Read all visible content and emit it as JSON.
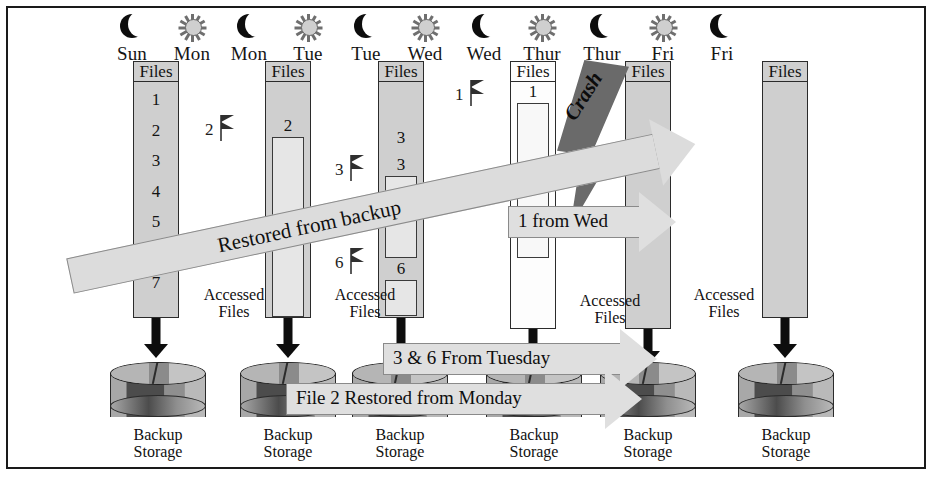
{
  "diagram": {
    "columns_header_label": "Files",
    "accessed_files_label": "Accessed\nFiles",
    "accessed_label_line1": "Accessed",
    "accessed_label_line2": "Files",
    "backup_label_line1": "Backup",
    "backup_label_line2": "Storage",
    "crash_label": "Crash"
  },
  "day_headers": [
    {
      "icon": "moon-icon",
      "phase": "night",
      "label": "Sun",
      "x": 132
    },
    {
      "icon": "sun-icon",
      "phase": "day",
      "label": "Mon",
      "x": 192
    },
    {
      "icon": "moon-icon",
      "phase": "night",
      "label": "Mon",
      "x": 249
    },
    {
      "icon": "sun-icon",
      "phase": "day",
      "label": "Tue",
      "x": 308
    },
    {
      "icon": "moon-icon",
      "phase": "night",
      "label": "Tue",
      "x": 366
    },
    {
      "icon": "sun-icon",
      "phase": "day",
      "label": "Wed",
      "x": 425
    },
    {
      "icon": "moon-icon",
      "phase": "night",
      "label": "Wed",
      "x": 484
    },
    {
      "icon": "sun-icon",
      "phase": "day",
      "label": "Thur",
      "x": 542
    },
    {
      "icon": "moon-icon",
      "phase": "night",
      "label": "Thur",
      "x": 602
    },
    {
      "icon": "sun-icon",
      "phase": "day",
      "label": "Fri",
      "x": 663
    },
    {
      "icon": "moon-icon",
      "phase": "night",
      "label": "Fri",
      "x": 722
    }
  ],
  "file_columns": [
    {
      "day": "Sun",
      "header": "Files",
      "x": 133,
      "y": 61,
      "w": 46,
      "h": 257,
      "fill": "gray",
      "file_numbers": [
        "1",
        "2",
        "3",
        "4",
        "5",
        "6",
        "7"
      ],
      "bars": []
    },
    {
      "day": "Mon",
      "header": "Files",
      "x": 265,
      "y": 61,
      "w": 46,
      "h": 257,
      "fill": "gray",
      "file_numbers": [
        "2"
      ],
      "bars": [
        {
          "label": "2",
          "top": 137,
          "h": 180
        }
      ]
    },
    {
      "day": "Tue",
      "header": "Files",
      "x": 378,
      "y": 61,
      "w": 46,
      "h": 257,
      "fill": "gray",
      "file_numbers": [
        "3",
        "6"
      ],
      "bars": [
        {
          "label": "3",
          "top": 176,
          "h": 82
        },
        {
          "label": "6",
          "top": 280,
          "h": 36
        }
      ]
    },
    {
      "day": "Wed",
      "header": "Files",
      "x": 510,
      "y": 61,
      "w": 46,
      "h": 268,
      "fill": "white",
      "file_numbers": [
        "1"
      ],
      "bars": [
        {
          "label": "1",
          "top": 103,
          "h": 155
        }
      ]
    },
    {
      "day": "Thur",
      "header": "Files",
      "x": 625,
      "y": 61,
      "w": 46,
      "h": 268,
      "fill": "gray",
      "file_numbers": [],
      "bars": []
    },
    {
      "day": "Fri",
      "header": "Files",
      "x": 762,
      "y": 61,
      "w": 46,
      "h": 257,
      "fill": "gray",
      "file_numbers": [],
      "bars": []
    }
  ],
  "flags": [
    {
      "number": "2",
      "x": 205,
      "y": 115
    },
    {
      "number": "3",
      "x": 335,
      "y": 155
    },
    {
      "number": "6",
      "x": 335,
      "y": 248
    },
    {
      "number": "1",
      "x": 455,
      "y": 80
    }
  ],
  "accessed_labels": [
    {
      "x": 186,
      "y": 286
    },
    {
      "x": 317,
      "y": 286
    },
    {
      "x": 562,
      "y": 292
    },
    {
      "x": 676,
      "y": 286
    }
  ],
  "backup_cylinders": [
    {
      "x": 110,
      "y": 362,
      "label_line1": "Backup",
      "label_line2": "Storage"
    },
    {
      "x": 240,
      "y": 362,
      "label_line1": "Backup",
      "label_line2": "Storage"
    },
    {
      "x": 352,
      "y": 362,
      "label_line1": "Backup",
      "label_line2": "Storage"
    },
    {
      "x": 486,
      "y": 362,
      "label_line1": "Backup",
      "label_line2": "Storage"
    },
    {
      "x": 600,
      "y": 362,
      "label_line1": "Backup",
      "label_line2": "Storage"
    },
    {
      "x": 738,
      "y": 362,
      "label_line1": "Backup",
      "label_line2": "Storage"
    }
  ],
  "down_arrows": [
    {
      "x": 156,
      "y": 318,
      "h": 26
    },
    {
      "x": 288,
      "y": 318,
      "h": 26
    },
    {
      "x": 401,
      "y": 318,
      "h": 26
    },
    {
      "x": 533,
      "y": 329,
      "h": 22
    },
    {
      "x": 648,
      "y": 329,
      "h": 22
    },
    {
      "x": 785,
      "y": 318,
      "h": 26
    }
  ],
  "restore_arrows": [
    {
      "id": "one-from-wed",
      "text": "1 from Wed",
      "x": 508,
      "y": 192,
      "w": 132
    },
    {
      "id": "restored-from-backup",
      "text": "Restored from backup",
      "x": 70,
      "y": 258,
      "w": 600
    },
    {
      "id": "three-and-six-from-tuesday",
      "text": "3 & 6 From Tuesday",
      "x": 383,
      "y": 329,
      "w": 238
    },
    {
      "id": "file-two-restored-from-monday",
      "text": "File 2 Restored from Monday",
      "x": 286,
      "y": 369,
      "w": 320
    }
  ],
  "crash": {
    "label": "Crash",
    "x": 557,
    "y": 60
  },
  "colors": {
    "column_fill": "#cfcfcf",
    "column_border": "#2b2b2b",
    "bar_fill": "#e6e6e6",
    "arrow_fill": "#dedede",
    "arrow_border": "#8a8a8a",
    "crash_fill": "#6a6a6a",
    "ink": "#111111",
    "page_background": "#ffffff"
  }
}
